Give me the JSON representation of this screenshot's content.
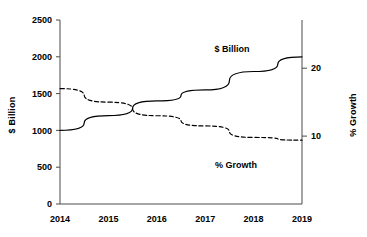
{
  "chart_data": {
    "type": "line",
    "title": "",
    "subtitle": "",
    "xlabel": "",
    "ylabel": "$ Billion",
    "y2label": "% Growth",
    "categories": [
      "2014",
      "2015",
      "2016",
      "2017",
      "2018",
      "2019"
    ],
    "x": [
      2014,
      2015,
      2016,
      2017,
      2018,
      2019
    ],
    "series": [
      {
        "name": "$ Billion",
        "axis": "left",
        "style": "solid",
        "color": "#000000",
        "values": [
          1000,
          1200,
          1400,
          1550,
          1800,
          2000
        ]
      },
      {
        "name": "% Growth",
        "axis": "right",
        "style": "dashed",
        "color": "#000000",
        "values": [
          17,
          15,
          13,
          11.5,
          9.8,
          9.4
        ]
      }
    ],
    "ylim": [
      0,
      2500
    ],
    "yticks": [
      0,
      500,
      1000,
      1500,
      2000,
      2500
    ],
    "yticklabels": [
      "0",
      "500",
      "1000",
      "1500",
      "2000",
      "2500"
    ],
    "y2lim": [
      0,
      27.1
    ],
    "y2ticks": [
      10,
      20
    ],
    "y2ticklabels": [
      "10",
      "20"
    ],
    "xticklabels": [
      "2014",
      "2015",
      "2016",
      "2017",
      "2018",
      "2019"
    ],
    "grid": false,
    "legend": "inline-annotations",
    "annotations": [
      {
        "text": "$ Billion",
        "x_px": 232,
        "y_px": 52
      },
      {
        "text": "% Growth",
        "x_px": 236,
        "y_px": 168
      }
    ]
  },
  "axes": {
    "left_title": "$ Billion",
    "right_title": "% Growth"
  }
}
